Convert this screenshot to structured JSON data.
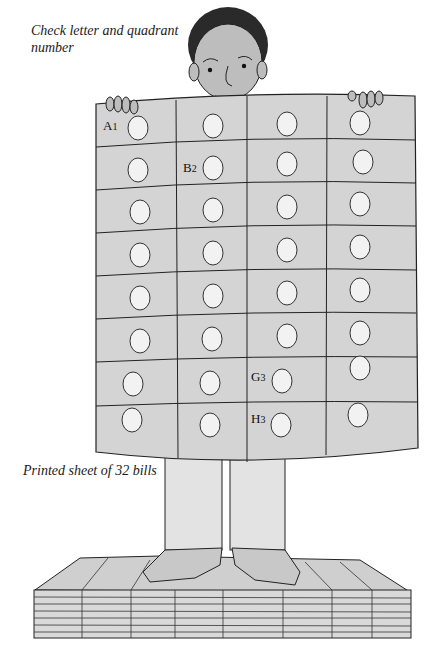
{
  "captions": {
    "top": "Check letter and quadrant number",
    "bottom": "Printed sheet of 32 bills"
  },
  "sheet": {
    "rows": 8,
    "columns": 4,
    "total_bills": 32,
    "labels": [
      {
        "letter": "A",
        "number": "1",
        "row": 0,
        "col": 0
      },
      {
        "letter": "B",
        "number": "2",
        "row": 1,
        "col": 1
      },
      {
        "letter": "G",
        "number": "3",
        "row": 6,
        "col": 2
      },
      {
        "letter": "H",
        "number": "3",
        "row": 7,
        "col": 2
      }
    ]
  },
  "colors": {
    "sheet_fill": "#d4d4d4",
    "bill_window": "#f7f7f7",
    "ink": "#222222",
    "skin": "#bdbdbd",
    "hair": "#2a2a2a"
  }
}
